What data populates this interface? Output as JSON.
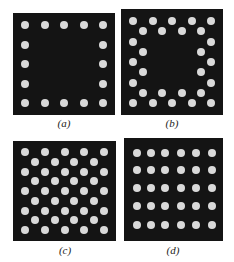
{
  "figure": {
    "panels": [
      {
        "id": "a",
        "caption": "(a)",
        "pattern": "square-perimeter",
        "description": "5x5 grid perimeter only",
        "dot_count": 16,
        "grid": {
          "rows": 5,
          "cols": 5
        },
        "dots": [
          [
            0,
            0
          ],
          [
            0,
            1
          ],
          [
            0,
            2
          ],
          [
            0,
            3
          ],
          [
            0,
            4
          ],
          [
            1,
            0
          ],
          [
            1,
            4
          ],
          [
            2,
            0
          ],
          [
            2,
            4
          ],
          [
            3,
            0
          ],
          [
            3,
            4
          ],
          [
            4,
            0
          ],
          [
            4,
            1
          ],
          [
            4,
            2
          ],
          [
            4,
            3
          ],
          [
            4,
            4
          ]
        ]
      },
      {
        "id": "b",
        "caption": "(b)",
        "pattern": "double-ring-perimeter",
        "description": "outer 5x5 perimeter plus staggered inner 4x4 perimeter",
        "dot_count": 28,
        "grid": {
          "rows": 9,
          "cols": 9
        },
        "dots": [
          [
            0,
            0
          ],
          [
            0,
            2
          ],
          [
            0,
            4
          ],
          [
            0,
            6
          ],
          [
            0,
            8
          ],
          [
            1,
            1
          ],
          [
            1,
            3
          ],
          [
            1,
            5
          ],
          [
            1,
            7
          ],
          [
            2,
            0
          ],
          [
            2,
            8
          ],
          [
            3,
            1
          ],
          [
            3,
            7
          ],
          [
            4,
            0
          ],
          [
            4,
            8
          ],
          [
            5,
            1
          ],
          [
            5,
            7
          ],
          [
            6,
            0
          ],
          [
            6,
            8
          ],
          [
            7,
            1
          ],
          [
            7,
            3
          ],
          [
            7,
            5
          ],
          [
            7,
            7
          ],
          [
            8,
            0
          ],
          [
            8,
            2
          ],
          [
            8,
            4
          ],
          [
            8,
            6
          ],
          [
            8,
            8
          ]
        ]
      },
      {
        "id": "c",
        "caption": "(c)",
        "pattern": "staggered-hex-full",
        "description": "alternating rows of 5 and 4 dots, fully filled",
        "dot_count": 41,
        "grid": {
          "rows": 9,
          "cols": 9
        },
        "dots": [
          [
            0,
            0
          ],
          [
            0,
            2
          ],
          [
            0,
            4
          ],
          [
            0,
            6
          ],
          [
            0,
            8
          ],
          [
            1,
            1
          ],
          [
            1,
            3
          ],
          [
            1,
            5
          ],
          [
            1,
            7
          ],
          [
            2,
            0
          ],
          [
            2,
            2
          ],
          [
            2,
            4
          ],
          [
            2,
            6
          ],
          [
            2,
            8
          ],
          [
            3,
            1
          ],
          [
            3,
            3
          ],
          [
            3,
            5
          ],
          [
            3,
            7
          ],
          [
            4,
            0
          ],
          [
            4,
            2
          ],
          [
            4,
            4
          ],
          [
            4,
            6
          ],
          [
            4,
            8
          ],
          [
            5,
            1
          ],
          [
            5,
            3
          ],
          [
            5,
            5
          ],
          [
            5,
            7
          ],
          [
            6,
            0
          ],
          [
            6,
            2
          ],
          [
            6,
            4
          ],
          [
            6,
            6
          ],
          [
            6,
            8
          ],
          [
            7,
            1
          ],
          [
            7,
            3
          ],
          [
            7,
            5
          ],
          [
            7,
            7
          ],
          [
            8,
            0
          ],
          [
            8,
            2
          ],
          [
            8,
            4
          ],
          [
            8,
            6
          ],
          [
            8,
            8
          ]
        ]
      },
      {
        "id": "d",
        "caption": "(d)",
        "pattern": "rectangular-full",
        "description": "5 rows x 6 columns filled grid",
        "dot_count": 30,
        "grid": {
          "rows": 5,
          "cols": 6
        },
        "dots": "all"
      }
    ],
    "colors": {
      "background": "#141414",
      "dot": "#d9d9d9"
    }
  }
}
